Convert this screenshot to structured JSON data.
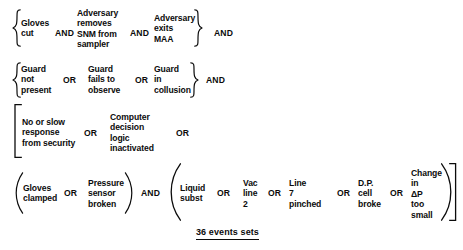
{
  "diagram": {
    "title": "36 events sets",
    "stroke_color": "#0b0b0b",
    "background_color": "#ffffff",
    "caption": "36 events sets",
    "rows": [
      {
        "id": "row-gloves-cut",
        "left_delimiter": "curly-brace-open",
        "right_delimiter": "curly-brace-close",
        "inner_operator": "AND",
        "trailing_operator": "AND",
        "terms": [
          "Gloves\ncut",
          "Adversary\nremoves\nSNM from\nsampler",
          "Adversary\nexits\nMAA"
        ],
        "operators": [
          "AND",
          "AND"
        ]
      },
      {
        "id": "row-guard",
        "left_delimiter": "curly-brace-open",
        "right_delimiter": "curly-brace-close",
        "inner_operator": "OR",
        "trailing_operator": "AND",
        "terms": [
          "Guard\nnot\npresent",
          "Guard\nfails to\nobserve",
          "Guard\nin\ncollusion"
        ],
        "operators": [
          "OR",
          "OR"
        ]
      },
      {
        "id": "row-response",
        "left_delimiter": "square-bracket-open",
        "right_delimiter": "none",
        "inner_operator": "OR",
        "trailing_operator": "OR",
        "terms": [
          "No or slow\nresponse\nfrom security",
          "Computer\ndecision\nlogic\ninactivated"
        ],
        "operators": [
          "OR",
          "OR"
        ]
      },
      {
        "id": "row-gloves-clamped",
        "left_delimiter": "paren-open",
        "right_delimiter": "paren-close",
        "inner_operator": "OR",
        "trailing_operator": "AND",
        "terms": [
          "Gloves\nclamped",
          "Pressure\nsensor\nbroken"
        ],
        "operators": [
          "OR"
        ]
      },
      {
        "id": "row-liquid",
        "left_delimiter": "paren-open",
        "right_delimiter": "paren-close",
        "inner_operator": "OR",
        "trailing_operator": "",
        "terms": [
          "Liquid\nsubst",
          "Vac\nline\n2",
          "Line\n7\npinched",
          "D.P.\ncell\nbroke",
          "Change\nin\nΔP\ntoo\nsmall"
        ],
        "operators": [
          "OR",
          "OR",
          "OR",
          "OR"
        ]
      }
    ],
    "outer_bracket": {
      "left": "square-bracket-open",
      "right": "square-bracket-close"
    },
    "labels": {
      "and": "AND",
      "or": "OR"
    }
  }
}
